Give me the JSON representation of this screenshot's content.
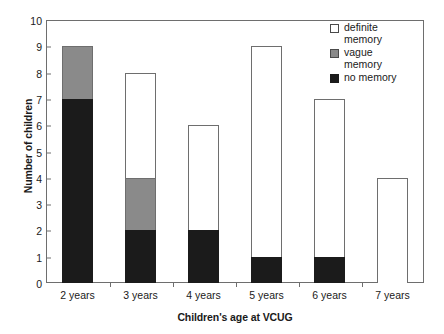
{
  "chart_data": {
    "type": "bar",
    "stacked": true,
    "title": "",
    "xlabel": "Children's age at VCUG",
    "ylabel": "Number of children",
    "categories": [
      "2 years",
      "3 years",
      "4 years",
      "5 years",
      "6 years",
      "7 years"
    ],
    "ylim": [
      0,
      10
    ],
    "yticks": [
      0,
      1,
      2,
      3,
      4,
      5,
      6,
      7,
      8,
      9,
      10
    ],
    "grid": false,
    "legend_position": "top-right",
    "series": [
      {
        "name": "no memory",
        "swatch": "no-memory",
        "color": "#1b1b1b",
        "values": [
          7,
          2,
          2,
          1,
          1,
          0
        ]
      },
      {
        "name": "vague memory",
        "swatch": "vague-memory",
        "color": "#8a8a8a",
        "values": [
          2,
          2,
          0,
          0,
          0,
          0
        ]
      },
      {
        "name": "definite memory",
        "swatch": "definite-memory",
        "color": "#ffffff",
        "values": [
          0,
          4,
          4,
          8,
          6,
          4
        ]
      }
    ],
    "totals": [
      9,
      8,
      6,
      9,
      7,
      4
    ]
  },
  "axes": {
    "y_title": "Number of children",
    "x_title": "Children's age at VCUG",
    "y_tick_labels": [
      "10",
      "9",
      "8",
      "7",
      "6",
      "5",
      "4",
      "3",
      "2",
      "1",
      "0"
    ],
    "x_tick_labels": [
      "2 years",
      "3 years",
      "4 years",
      "5 years",
      "6 years",
      "7 years"
    ]
  },
  "legend": {
    "items": [
      {
        "label": "definite\nmemory",
        "swatch": "definite-memory"
      },
      {
        "label": "vague\nmemory",
        "swatch": "vague-memory"
      },
      {
        "label": "no memory",
        "swatch": "no-memory"
      }
    ]
  },
  "colors": {
    "no_memory": "#1b1b1b",
    "vague_memory": "#8a8a8a",
    "definite_memory": "#ffffff",
    "axis": "#6e6e6e",
    "text": "#1a1a1a"
  }
}
